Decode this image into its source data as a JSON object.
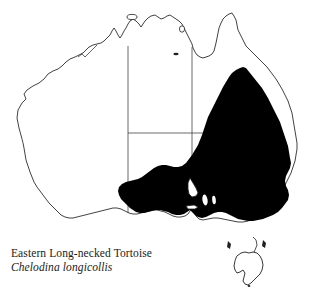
{
  "figure": {
    "type": "species-distribution-map",
    "region": "Australia",
    "background_color": "#ffffff",
    "width": 313,
    "height": 294
  },
  "caption": {
    "common_name": "Eastern Long-necked Tortoise",
    "scientific_name": "Chelodina longicollis"
  },
  "map": {
    "outline_color": "#231f20",
    "outline_width": 0.8,
    "range_fill_color": "#000000",
    "land_fill_color": "#ffffff",
    "state_border_color": "#3a3a3a",
    "state_border_width": 0.7,
    "features": {
      "mainland_label": "Australian mainland outline",
      "tasmania_label": "Tasmania outline (outside range)",
      "range_label": "Shaded distribution range: eastern Australia",
      "state_borders_label": "Internal state and territory boundaries"
    }
  }
}
